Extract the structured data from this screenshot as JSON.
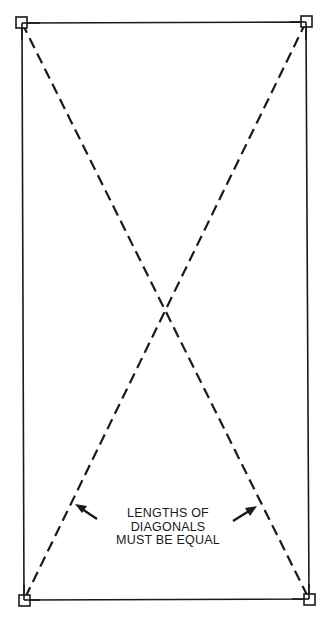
{
  "diagram": {
    "annotation": {
      "lines": [
        "LENGTHS OF",
        "DIAGONALS",
        "MUST BE EQUAL"
      ]
    },
    "colors": {
      "stroke": "#1a1a1a",
      "background": "#ffffff"
    },
    "corners": [
      {
        "name": "top-left",
        "x": 22,
        "y": 23
      },
      {
        "name": "top-right",
        "x": 306,
        "y": 22
      },
      {
        "name": "bottom-left",
        "x": 24,
        "y": 600
      },
      {
        "name": "bottom-right",
        "x": 309,
        "y": 599
      }
    ],
    "diagonals": [
      {
        "from": "top-left",
        "to": "bottom-right",
        "style": "dashed"
      },
      {
        "from": "top-right",
        "to": "bottom-left",
        "style": "dashed"
      }
    ]
  }
}
